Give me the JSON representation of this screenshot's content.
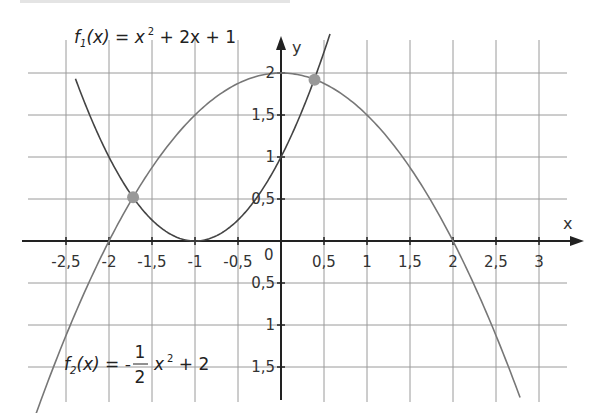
{
  "chart_data": {
    "type": "line",
    "title": "",
    "xlabel": "x",
    "ylabel": "y",
    "xlim": [
      -2.5,
      3
    ],
    "ylim": [
      -1.5,
      2
    ],
    "grid": true,
    "x_ticks": [
      "-2,5",
      "-2",
      "-1,5",
      "-1",
      "-0,5",
      "0,5",
      "1",
      "1,5",
      "2",
      "2,5",
      "3"
    ],
    "x_tick_values": [
      -2.5,
      -2,
      -1.5,
      -1,
      -0.5,
      0.5,
      1,
      1.5,
      2,
      2.5,
      3
    ],
    "y_ticks": [
      "2",
      "1,5",
      "1",
      "0,5",
      "0,5",
      "1",
      "1,5"
    ],
    "y_tick_values": [
      2,
      1.5,
      1,
      0.5,
      -0.5,
      -1,
      -1.5
    ],
    "origin_label": "0",
    "series": [
      {
        "name": "f1",
        "label_parts": {
          "func": "f",
          "sub": "1",
          "arg": "(x) = x",
          "sup": "2",
          "rest": " + 2x + 1"
        },
        "expression": "x^2 + 2x + 1",
        "color": "#444444",
        "x": [
          -2.5,
          -2,
          -1.5,
          -1,
          -0.5,
          0,
          0.5
        ],
        "y": [
          2.25,
          1,
          0.25,
          0,
          0.25,
          1,
          2.25
        ]
      },
      {
        "name": "f2",
        "label_parts": {
          "func": "f",
          "sub": "2",
          "arg": "(x) = -",
          "num": "1",
          "den": "2",
          "var": "x",
          "sup": "2",
          "rest": " + 2"
        },
        "expression": "-1/2 x^2 + 2",
        "color": "#777777",
        "x": [
          -2.5,
          -2,
          -1.5,
          -1,
          -0.5,
          0,
          0.5,
          1,
          1.5,
          2,
          2.5
        ],
        "y": [
          -1.125,
          0,
          0.875,
          1.5,
          1.875,
          2,
          1.875,
          1.5,
          0.875,
          0,
          -1.125
        ]
      }
    ],
    "intersections": [
      {
        "x": -1.72,
        "y": 0.52
      },
      {
        "x": 0.39,
        "y": 1.92
      }
    ],
    "intersection_color": "#999999"
  }
}
